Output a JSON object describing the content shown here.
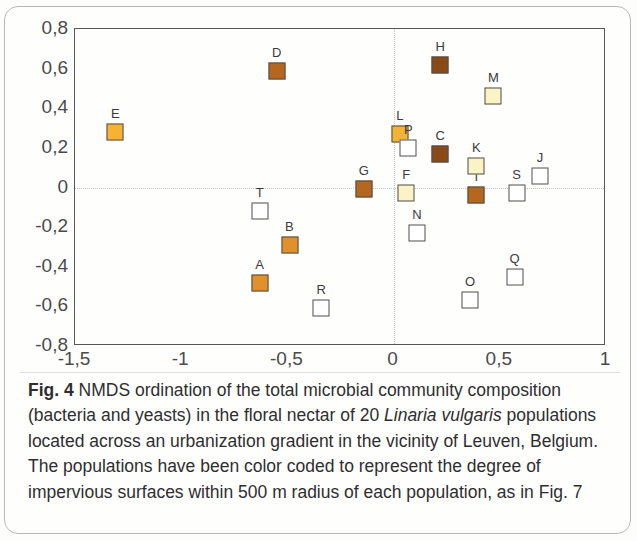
{
  "figure": {
    "label": "Fig. 4",
    "caption_parts": {
      "before_italic": " NMDS ordination of the total microbial community composition (bacteria and yeasts) in the floral nectar of 20 ",
      "italic": "Linaria vulgaris",
      "after_italic": " populations located across an urbanization gradient in the vicinity of Leuven, Belgium. The populations have been color coded to represent the degree of impervious surfaces within 500 m radius of each population, as in Fig. 7"
    }
  },
  "chart_data": {
    "type": "scatter",
    "title": "",
    "xlabel": "",
    "ylabel": "",
    "xlim": [
      -1.5,
      1
    ],
    "ylim": [
      -0.8,
      0.8
    ],
    "grid": false,
    "legend": "none",
    "zero_reference_lines": true,
    "x_ticks": [
      "-1,5",
      "-1",
      "-0,5",
      "0",
      "0,5",
      "1"
    ],
    "x_tick_values": [
      -1.5,
      -1,
      -0.5,
      0,
      0.5,
      1
    ],
    "y_ticks": [
      "0,8",
      "0,6",
      "0,4",
      "0,2",
      "0",
      "-0,2",
      "-0,4",
      "-0,6",
      "-0,8"
    ],
    "y_tick_values": [
      0.8,
      0.6,
      0.4,
      0.2,
      0,
      -0.2,
      -0.4,
      -0.6,
      -0.8
    ],
    "marker_shape": "square",
    "color_scale_meaning": "degree of impervious surfaces within 500 m radius",
    "colors": {
      "white": "#ffffff",
      "cream": "#faf3c6",
      "orange": "#f5b334",
      "dark_orange": "#e0912b",
      "brown": "#b5671f",
      "dark_brown": "#8a4a18",
      "marker_outline": "#4e4e50",
      "axis": "#58585a",
      "zero_line": "#c3c3c0"
    },
    "points": [
      {
        "label": "A",
        "x": -0.63,
        "y": -0.48,
        "color": "#e0912b"
      },
      {
        "label": "B",
        "x": -0.49,
        "y": -0.29,
        "color": "#e0912b"
      },
      {
        "label": "C",
        "x": 0.22,
        "y": 0.17,
        "color": "#8a4a18"
      },
      {
        "label": "D",
        "x": -0.55,
        "y": 0.59,
        "color": "#b5671f"
      },
      {
        "label": "E",
        "x": -1.31,
        "y": 0.28,
        "color": "#f5b334"
      },
      {
        "label": "F",
        "x": 0.06,
        "y": -0.03,
        "color": "#faf3c6"
      },
      {
        "label": "G",
        "x": -0.14,
        "y": -0.01,
        "color": "#b5671f"
      },
      {
        "label": "H",
        "x": 0.22,
        "y": 0.62,
        "color": "#8a4a18"
      },
      {
        "label": "I",
        "x": 0.39,
        "y": -0.04,
        "color": "#b5671f"
      },
      {
        "label": "J",
        "x": 0.69,
        "y": 0.06,
        "color": "#ffffff"
      },
      {
        "label": "K",
        "x": 0.39,
        "y": 0.11,
        "color": "#faf3c6"
      },
      {
        "label": "L",
        "x": 0.03,
        "y": 0.27,
        "color": "#f5b334"
      },
      {
        "label": "M",
        "x": 0.47,
        "y": 0.46,
        "color": "#faf3c6"
      },
      {
        "label": "N",
        "x": 0.11,
        "y": -0.23,
        "color": "#ffffff"
      },
      {
        "label": "O",
        "x": 0.36,
        "y": -0.57,
        "color": "#ffffff"
      },
      {
        "label": "P",
        "x": 0.07,
        "y": 0.2,
        "color": "#ffffff"
      },
      {
        "label": "Q",
        "x": 0.57,
        "y": -0.45,
        "color": "#ffffff"
      },
      {
        "label": "R",
        "x": -0.34,
        "y": -0.61,
        "color": "#ffffff"
      },
      {
        "label": "S",
        "x": 0.58,
        "y": -0.03,
        "color": "#ffffff"
      },
      {
        "label": "T",
        "x": -0.63,
        "y": -0.12,
        "color": "#ffffff"
      }
    ]
  }
}
